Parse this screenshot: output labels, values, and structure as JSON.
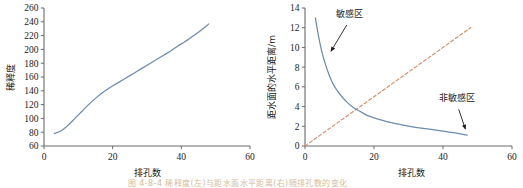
{
  "figure": {
    "caption": "图 4-8-4  稀释度(左)与距水面水平距离(右)随排孔数的变化",
    "background": "#ffffff"
  },
  "colors": {
    "curve_blue": "#6d8cb0",
    "dashed_orange": "#e08a5f",
    "axis": "#6b6b6b",
    "text": "#1b1b1b"
  },
  "chart_data": [
    {
      "id": "left",
      "type": "line",
      "title": "",
      "xlabel": "排孔数",
      "ylabel": "稀释度",
      "xlim": [
        0,
        60
      ],
      "ylim": [
        60,
        260
      ],
      "xticks": [
        0,
        20,
        40,
        60
      ],
      "yticks": [
        60,
        80,
        100,
        120,
        140,
        160,
        180,
        200,
        220,
        240,
        260
      ],
      "xtick_labels": [
        "0",
        "20",
        "40",
        "60"
      ],
      "ytick_labels": [
        "60",
        "80",
        "100",
        "120",
        "140",
        "160",
        "180",
        "200",
        "220",
        "240",
        "260"
      ],
      "grid": false,
      "legend": "none",
      "series": [
        {
          "name": "稀释度",
          "color": "#6d8cb0",
          "style": "solid",
          "x": [
            3,
            5,
            7,
            9,
            11,
            13,
            15,
            17,
            19,
            21,
            23,
            25,
            27,
            29,
            31,
            33,
            35,
            37,
            39,
            41,
            43,
            45,
            48
          ],
          "values": [
            78,
            82,
            90,
            100,
            110,
            120,
            129,
            137,
            144,
            150,
            156,
            162,
            168,
            174,
            180,
            186,
            192,
            198,
            205,
            211,
            218,
            225,
            237
          ]
        }
      ]
    },
    {
      "id": "right",
      "type": "line",
      "title": "",
      "xlabel": "排孔数",
      "ylabel": "距水面的水平距离/m",
      "xlim": [
        0,
        60
      ],
      "ylim": [
        0,
        14
      ],
      "xticks": [
        0,
        20,
        40,
        60
      ],
      "yticks": [
        0,
        2,
        4,
        6,
        8,
        10,
        12,
        14
      ],
      "xtick_labels": [
        "0",
        "20",
        "40",
        "60"
      ],
      "ytick_labels": [
        "0",
        "2",
        "4",
        "6",
        "8",
        "10",
        "12",
        "14"
      ],
      "grid": false,
      "legend": "none",
      "series": [
        {
          "name": "敏感区边界",
          "color": "#6d8cb0",
          "style": "solid",
          "x": [
            3,
            4,
            5,
            6,
            7,
            8,
            9,
            10,
            12,
            14,
            16,
            18,
            20,
            24,
            28,
            32,
            36,
            40,
            44,
            47
          ],
          "values": [
            13.0,
            11.0,
            9.4,
            8.2,
            7.2,
            6.4,
            5.8,
            5.3,
            4.5,
            3.9,
            3.5,
            3.1,
            2.85,
            2.45,
            2.15,
            1.9,
            1.7,
            1.5,
            1.3,
            1.1
          ]
        },
        {
          "name": "参考线",
          "color": "#e08a5f",
          "style": "dashed",
          "x": [
            0,
            48
          ],
          "values": [
            0,
            12
          ]
        }
      ],
      "annotations": [
        {
          "name": "sensitive-zone",
          "text": "敏感区",
          "label_x": 13,
          "label_y": 13.1,
          "arrow_to_x": 7.5,
          "arrow_to_y": 9.6
        },
        {
          "name": "non-sensitive-zone",
          "text": "非敏感区",
          "label_x": 44,
          "label_y": 4.6,
          "arrow_to_x": 46.5,
          "arrow_to_y": 1.7
        }
      ]
    }
  ]
}
